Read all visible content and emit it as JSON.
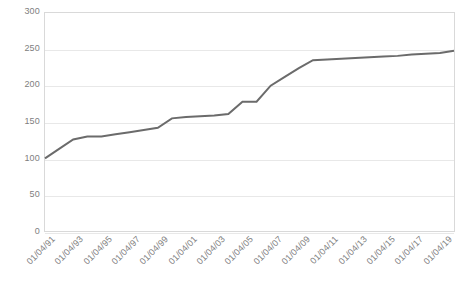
{
  "chart_data": {
    "type": "line",
    "title": "",
    "xlabel": "",
    "ylabel": "",
    "ylim": [
      0,
      300
    ],
    "ytick_step": 50,
    "yticks": [
      300,
      250,
      200,
      150,
      100,
      50,
      0
    ],
    "grid": true,
    "legend": false,
    "legend_position": "none",
    "line_color": "#6b6b6b",
    "line_width": 2,
    "markers": false,
    "categories": [
      "01/04/91",
      "01/04/92",
      "01/04/93",
      "01/04/94",
      "01/04/95",
      "01/04/96",
      "01/04/97",
      "01/04/98",
      "01/04/99",
      "01/04/00",
      "01/04/01",
      "01/04/02",
      "01/04/03",
      "01/04/04",
      "01/04/05",
      "01/04/06",
      "01/04/07",
      "01/04/08",
      "01/04/09",
      "01/04/10",
      "01/04/11",
      "01/04/12",
      "01/04/13",
      "01/04/14",
      "01/04/15",
      "01/04/16",
      "01/04/17",
      "01/04/18",
      "01/04/19",
      "01/04/20"
    ],
    "xtick_labels": [
      "01/04/91",
      "01/04/93",
      "01/04/95",
      "01/04/97",
      "01/04/99",
      "01/04/01",
      "01/04/03",
      "01/04/05",
      "01/04/07",
      "01/04/09",
      "01/04/11",
      "01/04/13",
      "01/04/15",
      "01/04/17",
      "01/04/19"
    ],
    "values": [
      100,
      113,
      126,
      130,
      130,
      133,
      136,
      139,
      142,
      155,
      157,
      158,
      159,
      161,
      178,
      178,
      200,
      212,
      224,
      235,
      236,
      237,
      238,
      239,
      240,
      241,
      243,
      244,
      245,
      248
    ]
  }
}
